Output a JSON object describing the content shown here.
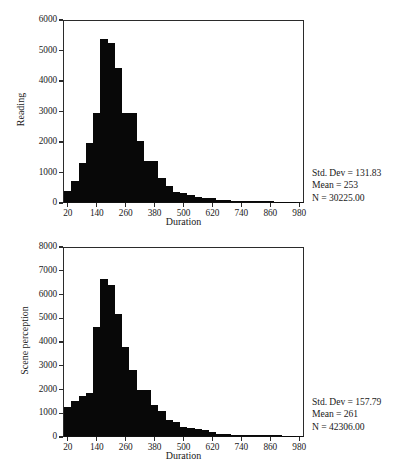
{
  "figures": [
    {
      "id": "reading",
      "ylabel": "Reading",
      "xlabel": "Duration",
      "stats": {
        "std_dev": "Std. Dev = 131.83",
        "mean": "Mean = 253",
        "n": "N = 30225.00"
      }
    },
    {
      "id": "scene",
      "ylabel": "Scene perception",
      "xlabel": "Duration",
      "stats": {
        "std_dev": "Std. Dev = 157.79",
        "mean": "Mean = 261",
        "n": "N = 42306.00"
      }
    }
  ],
  "chart_data": [
    {
      "type": "bar",
      "title": "",
      "subtitle": "",
      "xlabel": "Duration",
      "ylabel": "Reading",
      "grid": false,
      "legend": false,
      "xlim": [
        0,
        1000
      ],
      "ylim": [
        0,
        6000
      ],
      "xticks": [
        20,
        140,
        260,
        380,
        500,
        620,
        740,
        860,
        980
      ],
      "yticks": [
        0,
        1000,
        2000,
        3000,
        4000,
        5000,
        6000
      ],
      "bin_width": 30,
      "bin_centers": [
        20,
        50,
        80,
        110,
        140,
        170,
        200,
        230,
        260,
        290,
        320,
        350,
        380,
        410,
        440,
        470,
        500,
        530,
        560,
        590,
        620,
        650,
        680,
        710,
        740,
        770,
        800,
        830,
        860,
        890,
        920,
        950,
        980
      ],
      "categories": [
        "20",
        "50",
        "80",
        "110",
        "140",
        "170",
        "200",
        "230",
        "260",
        "290",
        "320",
        "350",
        "380",
        "410",
        "440",
        "470",
        "500",
        "530",
        "560",
        "590",
        "620",
        "650",
        "680",
        "710",
        "740",
        "770",
        "800",
        "830",
        "860",
        "890",
        "920",
        "950",
        "980"
      ],
      "values": [
        380,
        700,
        1300,
        1950,
        2950,
        5420,
        5280,
        4430,
        2960,
        2960,
        2030,
        1350,
        1350,
        800,
        530,
        330,
        300,
        230,
        150,
        130,
        120,
        70,
        60,
        50,
        40,
        40,
        20,
        20,
        20,
        15,
        5,
        5,
        0
      ],
      "annotations": [
        "Std. Dev = 131.83",
        "Mean = 253",
        "N = 30225.00"
      ],
      "statistics": {
        "std_dev": 131.83,
        "mean": 253,
        "n": 30225.0
      }
    },
    {
      "type": "bar",
      "title": "",
      "subtitle": "",
      "xlabel": "Duration",
      "ylabel": "Scene perception",
      "grid": false,
      "legend": false,
      "xlim": [
        0,
        1000
      ],
      "ylim": [
        0,
        8000
      ],
      "xticks": [
        20,
        140,
        260,
        380,
        500,
        620,
        740,
        860,
        980
      ],
      "yticks": [
        0,
        1000,
        2000,
        3000,
        4000,
        5000,
        6000,
        7000,
        8000
      ],
      "bin_width": 30,
      "bin_centers": [
        20,
        50,
        80,
        110,
        140,
        170,
        200,
        230,
        260,
        290,
        320,
        350,
        380,
        410,
        440,
        470,
        500,
        530,
        560,
        590,
        620,
        650,
        680,
        710,
        740,
        770,
        800,
        830,
        860,
        890,
        920,
        950,
        980
      ],
      "categories": [
        "20",
        "50",
        "80",
        "110",
        "140",
        "170",
        "200",
        "230",
        "260",
        "290",
        "320",
        "350",
        "380",
        "410",
        "440",
        "470",
        "500",
        "530",
        "560",
        "590",
        "620",
        "650",
        "680",
        "710",
        "740",
        "770",
        "800",
        "830",
        "860",
        "890",
        "920",
        "950",
        "980"
      ],
      "values": [
        1230,
        1490,
        1700,
        1820,
        4620,
        6690,
        6420,
        5180,
        3780,
        2800,
        1960,
        1960,
        1320,
        1060,
        700,
        590,
        400,
        340,
        300,
        250,
        170,
        70,
        70,
        60,
        45,
        40,
        40,
        35,
        60,
        30,
        10,
        5,
        0
      ],
      "annotations": [
        "Std. Dev = 157.79",
        "Mean = 261",
        "N = 42306.00"
      ],
      "statistics": {
        "std_dev": 157.79,
        "mean": 261,
        "n": 42306.0
      }
    }
  ]
}
